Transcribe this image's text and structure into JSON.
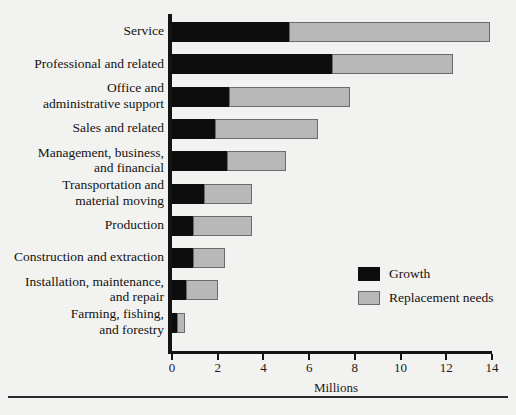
{
  "chart_data": {
    "type": "bar",
    "orientation": "horizontal",
    "stacked": true,
    "title": "",
    "xlabel": "Millions",
    "ylabel": "",
    "xlim": [
      0,
      14
    ],
    "xticks": [
      0,
      2,
      4,
      6,
      8,
      10,
      12,
      14
    ],
    "xtick_labels": [
      "0",
      "2",
      "4",
      "6",
      "8",
      "10",
      "12",
      "14"
    ],
    "grid": false,
    "legend_position": "center-right",
    "categories": [
      "Service",
      "Professional and related",
      "Office and\nadministrative support",
      "Sales and related",
      "Management, business,\nand financial",
      "Transportation and\nmaterial moving",
      "Production",
      "Construction and extraction",
      "Installation, maintenance,\nand repair",
      "Farming, fishing,\nand forestry"
    ],
    "series": [
      {
        "name": "Growth",
        "color": "#0d0d0d",
        "values": [
          5.1,
          7.0,
          2.5,
          1.9,
          2.4,
          1.4,
          0.9,
          0.9,
          0.6,
          0.2
        ]
      },
      {
        "name": "Replacement needs",
        "color": "#b8b8b8",
        "values": [
          8.8,
          5.3,
          5.3,
          4.5,
          2.6,
          2.1,
          2.6,
          1.4,
          1.4,
          0.35
        ]
      }
    ],
    "totals": [
      13.9,
      12.3,
      7.8,
      6.4,
      5.0,
      3.5,
      3.5,
      2.3,
      2.0,
      0.55
    ]
  },
  "legend": {
    "items": [
      {
        "label": "Growth",
        "swatch": "black-square-swatch"
      },
      {
        "label": "Replacement needs",
        "swatch": "gray-square-swatch"
      }
    ]
  },
  "axis": {
    "x_title": "Millions"
  },
  "footer": {
    "source_note": ""
  }
}
